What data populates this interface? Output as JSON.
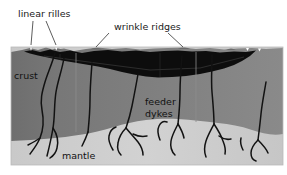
{
  "figure": {
    "type": "geological-cross-section",
    "title_visible": false,
    "background": "#ffffff",
    "box": {
      "x": 11,
      "y": 47,
      "width": 272,
      "height": 118
    }
  },
  "palette": {
    "crust": "#7d7d7d",
    "crust_left_shadow": "#6f6f6f",
    "mantle": "#cfcfcf",
    "basalt_fill": "#0d0d0d",
    "line": "#121212",
    "leader": "#4a4a4a",
    "text": "#1a1a1a",
    "page": "#ffffff"
  },
  "labels": {
    "linear_rilles": {
      "text": "linear rilles",
      "x": 18,
      "y": 17
    },
    "wrinkle_ridges": {
      "text": "wrinkle ridges",
      "x": 114,
      "y": 30
    },
    "crust": {
      "text": "crust",
      "x": 14,
      "y": 79
    },
    "feeder": {
      "text": "feeder",
      "x": 145,
      "y": 105
    },
    "dykes": {
      "text": "dykes",
      "x": 145,
      "y": 117
    },
    "mantle": {
      "text": "mantle",
      "x": 62,
      "y": 159
    }
  },
  "leader_lines": [
    {
      "name": "linear-rilles-leader-1",
      "x1": 33,
      "y1": 21,
      "x2": 31,
      "y2": 45
    },
    {
      "name": "linear-rilles-leader-2",
      "x1": 46,
      "y1": 21,
      "x2": 56,
      "y2": 45
    },
    {
      "name": "wrinkle-ridges-leader-1",
      "x1": 109,
      "y1": 33,
      "x2": 96,
      "y2": 48
    },
    {
      "name": "wrinkle-ridges-leader-2",
      "x1": 168,
      "y1": 33,
      "x2": 183,
      "y2": 48
    }
  ],
  "layers": [
    {
      "name": "crust",
      "label": "crust",
      "color": "#7d7d7d"
    },
    {
      "name": "mantle",
      "label": "mantle",
      "color": "#cfcfcf"
    },
    {
      "name": "basalt-fill",
      "label": "feeder dykes",
      "color": "#0d0d0d"
    }
  ],
  "features": {
    "surface_ridges_count": 6,
    "dykes_count": 9,
    "basalt_lens_max_thickness_px": 22
  }
}
